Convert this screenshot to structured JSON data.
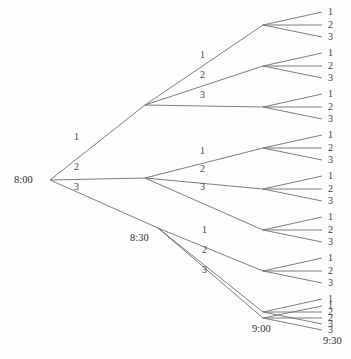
{
  "diagram": {
    "background_color": "#fdfdfd",
    "line_color": "#6e6e6e",
    "text_color": "#3b3b3b",
    "root": {
      "name": "root-node",
      "time_label": "8:00",
      "x": 50,
      "y": 180,
      "label_x": 14,
      "label_y": 175
    },
    "time_labels": [
      {
        "name": "time-label-800",
        "text": "8:00",
        "x": 14,
        "y": 175
      },
      {
        "name": "time-label-830",
        "text": "8:30",
        "x": 130,
        "y": 233
      },
      {
        "name": "time-label-900",
        "text": "9:00",
        "x": 252,
        "y": 324
      },
      {
        "name": "time-label-930",
        "text": "9:30",
        "x": 323,
        "y": 336
      }
    ],
    "level1": {
      "node_x": 50,
      "node_y": 180,
      "branches": [
        {
          "label": "1",
          "to_x": 145,
          "to_y": 105,
          "label_x": 74,
          "label_y": 132
        },
        {
          "label": "2",
          "to_x": 145,
          "to_y": 178,
          "label_x": 74,
          "label_y": 162
        },
        {
          "label": "3",
          "to_x": 158,
          "to_y": 228,
          "label_x": 74,
          "label_y": 182
        }
      ]
    },
    "level2": [
      {
        "node_x": 145,
        "node_y": 105,
        "branches": [
          {
            "label": "1",
            "to_x": 263,
            "to_y": 25,
            "label_x": 200,
            "label_y": 50
          },
          {
            "label": "2",
            "to_x": 263,
            "to_y": 66,
            "label_x": 200,
            "label_y": 70
          },
          {
            "label": "3",
            "to_x": 263,
            "to_y": 107,
            "label_x": 200,
            "label_y": 90
          }
        ]
      },
      {
        "node_x": 145,
        "node_y": 178,
        "branches": [
          {
            "label": "1",
            "to_x": 263,
            "to_y": 148,
            "label_x": 200,
            "label_y": 146
          },
          {
            "label": "2",
            "to_x": 263,
            "to_y": 189,
            "label_x": 200,
            "label_y": 164
          },
          {
            "label": "3",
            "to_x": 263,
            "to_y": 230,
            "label_x": 200,
            "label_y": 182
          }
        ]
      },
      {
        "node_x": 158,
        "node_y": 228,
        "branches": [
          {
            "label": "1",
            "to_x": 263,
            "to_y": 271,
            "label_x": 202,
            "label_y": 225
          },
          {
            "label": "2",
            "to_x": 263,
            "to_y": 312,
            "label_x": 202,
            "label_y": 245
          },
          {
            "label": "3",
            "to_x": 263,
            "to_y": 318,
            "label_x": 202,
            "label_y": 265
          }
        ]
      }
    ],
    "level3": [
      {
        "node_x": 263,
        "node_y": 25,
        "leaves": [
          {
            "label": "1",
            "to_x": 322,
            "to_y": 12
          },
          {
            "label": "2",
            "to_x": 322,
            "to_y": 25
          },
          {
            "label": "3",
            "to_x": 322,
            "to_y": 37
          }
        ]
      },
      {
        "node_x": 263,
        "node_y": 66,
        "leaves": [
          {
            "label": "1",
            "to_x": 322,
            "to_y": 53
          },
          {
            "label": "2",
            "to_x": 322,
            "to_y": 66
          },
          {
            "label": "3",
            "to_x": 322,
            "to_y": 78
          }
        ]
      },
      {
        "node_x": 263,
        "node_y": 107,
        "leaves": [
          {
            "label": "1",
            "to_x": 322,
            "to_y": 94
          },
          {
            "label": "2",
            "to_x": 322,
            "to_y": 107
          },
          {
            "label": "3",
            "to_x": 322,
            "to_y": 119
          }
        ]
      },
      {
        "node_x": 263,
        "node_y": 148,
        "leaves": [
          {
            "label": "1",
            "to_x": 322,
            "to_y": 135
          },
          {
            "label": "2",
            "to_x": 322,
            "to_y": 148
          },
          {
            "label": "3",
            "to_x": 322,
            "to_y": 160
          }
        ]
      },
      {
        "node_x": 263,
        "node_y": 189,
        "leaves": [
          {
            "label": "1",
            "to_x": 322,
            "to_y": 176
          },
          {
            "label": "2",
            "to_x": 322,
            "to_y": 189
          },
          {
            "label": "3",
            "to_x": 322,
            "to_y": 201
          }
        ]
      },
      {
        "node_x": 263,
        "node_y": 230,
        "leaves": [
          {
            "label": "1",
            "to_x": 322,
            "to_y": 217
          },
          {
            "label": "2",
            "to_x": 322,
            "to_y": 230
          },
          {
            "label": "3",
            "to_x": 322,
            "to_y": 242
          }
        ]
      },
      {
        "node_x": 263,
        "node_y": 271,
        "leaves": [
          {
            "label": "1",
            "to_x": 322,
            "to_y": 258
          },
          {
            "label": "2",
            "to_x": 322,
            "to_y": 271
          },
          {
            "label": "3",
            "to_x": 322,
            "to_y": 283
          }
        ]
      },
      {
        "node_x": 263,
        "node_y": 312,
        "leaves": [
          {
            "label": "1",
            "to_x": 322,
            "to_y": 299
          },
          {
            "label": "2",
            "to_x": 322,
            "to_y": 312
          },
          {
            "label": "3",
            "to_x": 322,
            "to_y": 324
          }
        ]
      },
      {
        "node_x": 263,
        "node_y": 318,
        "leaves": [
          {
            "label": "1",
            "to_x": 322,
            "to_y": 306
          },
          {
            "label": "2",
            "to_x": 322,
            "to_y": 318
          },
          {
            "label": "3",
            "to_x": 322,
            "to_y": 330
          }
        ]
      }
    ],
    "leaf_label_x": 328
  }
}
